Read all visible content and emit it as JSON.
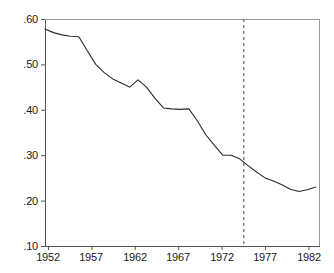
{
  "figure": {
    "background_color": "#ffffff",
    "line_color": "#2b2b2b",
    "axis_color": "#555555",
    "marker_line_color": "#4a4a4a"
  },
  "chart_data": {
    "type": "line",
    "title": "",
    "subtitle": "",
    "xlabel": "",
    "ylabel": "",
    "xlim": [
      1951,
      1983.5
    ],
    "ylim": [
      0.1,
      0.6
    ],
    "grid": false,
    "legend_position": "none",
    "x_ticks": [
      1952,
      1957,
      1962,
      1967,
      1972,
      1977,
      1982
    ],
    "x_tick_labels": [
      "1952",
      "1957",
      "1962",
      "1967",
      "1972",
      "1977",
      "1982"
    ],
    "y_ticks": [
      0.1,
      0.2,
      0.3,
      0.4,
      0.5,
      0.6
    ],
    "y_tick_labels": [
      ".10",
      ".20",
      ".30",
      ".40",
      ".50",
      ".60"
    ],
    "annotations": [
      {
        "name": "vertical-dashed-marker",
        "type": "vline",
        "x": 1974.5,
        "style": "dashed"
      }
    ],
    "series": [
      {
        "name": "share",
        "x": [
          1951,
          1952,
          1953,
          1954,
          1955,
          1956,
          1957,
          1958,
          1959,
          1960,
          1961,
          1962,
          1963,
          1964,
          1965,
          1966,
          1967,
          1968,
          1969,
          1970,
          1971,
          1972,
          1973,
          1974,
          1975,
          1976,
          1977,
          1978,
          1979,
          1980,
          1981,
          1982,
          1983
        ],
        "values": [
          0.578,
          0.57,
          0.565,
          0.562,
          0.561,
          0.53,
          0.5,
          0.482,
          0.468,
          0.459,
          0.45,
          0.466,
          0.45,
          0.425,
          0.404,
          0.402,
          0.401,
          0.402,
          0.376,
          0.345,
          0.322,
          0.3,
          0.3,
          0.292,
          0.277,
          0.263,
          0.25,
          0.243,
          0.235,
          0.225,
          0.22,
          0.224,
          0.23
        ]
      }
    ]
  },
  "caption": {
    "text": ""
  }
}
